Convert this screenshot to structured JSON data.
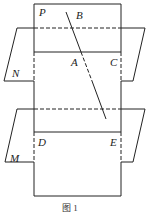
{
  "figure": {
    "caption": "图 1",
    "labels": {
      "P": "P",
      "B": "B",
      "N": "N",
      "A": "A",
      "C": "C",
      "M": "M",
      "D": "D",
      "E": "E"
    },
    "stroke_color": "#222222"
  }
}
